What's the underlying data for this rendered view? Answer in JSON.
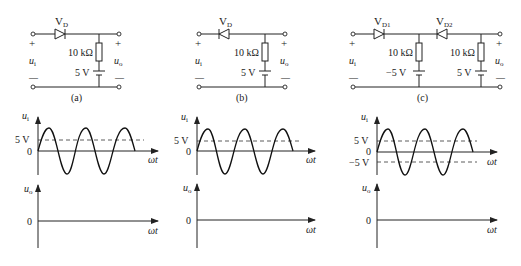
{
  "circuits": [
    {
      "id": "a",
      "caption": "(a)",
      "diode_label": "V",
      "diode_sub": "D",
      "diode_direction": "forward",
      "resistor_label": "10 kΩ",
      "battery_label": "5 V",
      "input_label": "u",
      "input_sub": "i",
      "output_label": "u",
      "output_sub": "o",
      "plus": "+",
      "minus": "—"
    },
    {
      "id": "b",
      "caption": "(b)",
      "diode_label": "V",
      "diode_sub": "D",
      "diode_direction": "reverse",
      "resistor_label": "10 kΩ",
      "battery_label": "5 V",
      "input_label": "u",
      "input_sub": "i",
      "output_label": "u",
      "output_sub": "o",
      "plus": "+",
      "minus": "—"
    },
    {
      "id": "c",
      "caption": "(c)",
      "diode1_label": "V",
      "diode1_sub": "D1",
      "diode2_label": "V",
      "diode2_sub": "D2",
      "resistor1_label": "10 kΩ",
      "battery1_label": "−5 V",
      "resistor2_label": "10 kΩ",
      "battery2_label": "5 V",
      "input_label": "u",
      "input_sub": "i",
      "output_label": "u",
      "output_sub": "o",
      "plus": "+",
      "minus": "—"
    }
  ],
  "waveforms": [
    {
      "id": "a",
      "y_label": "u",
      "y_sub": "i",
      "x_label": "ωt",
      "zero_label": "0",
      "level_labels": [
        "5 V"
      ]
    },
    {
      "id": "b",
      "y_label": "u",
      "y_sub": "i",
      "x_label": "ωt",
      "zero_label": "0",
      "level_labels": [
        "5 V"
      ]
    },
    {
      "id": "c",
      "y_label": "u",
      "y_sub": "i",
      "x_label": "ωt",
      "zero_label": "0",
      "level_labels": [
        "5 V",
        "−5 V"
      ]
    }
  ],
  "output_axes": [
    {
      "id": "a",
      "y_label": "u",
      "y_sub": "o",
      "x_label": "ωt",
      "zero_label": "0"
    },
    {
      "id": "b",
      "y_label": "u",
      "y_sub": "o",
      "x_label": "ωt",
      "zero_label": "0"
    },
    {
      "id": "c",
      "y_label": "u",
      "y_sub": "o",
      "x_label": "ωt",
      "zero_label": "0"
    }
  ]
}
